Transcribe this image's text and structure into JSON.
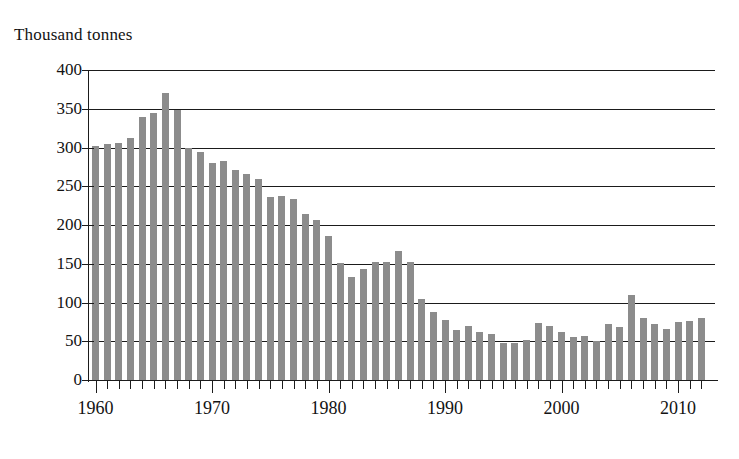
{
  "chart_data": {
    "type": "bar",
    "title": "",
    "subtitle": "",
    "unit_caption": "Thousand tonnes",
    "xlabel": "",
    "ylabel": "Thousand tonnes",
    "ylim": [
      0,
      400
    ],
    "y_ticks": [
      0,
      50,
      100,
      150,
      200,
      250,
      300,
      350,
      400
    ],
    "y_tick_labels": [
      "0",
      "50",
      "100",
      "150",
      "200",
      "250",
      "300",
      "350",
      "400"
    ],
    "grid": "horizontal",
    "legend": "none",
    "bar_color": "#8c8c8c",
    "axis_color": "#1b1b1b",
    "x_tick_labels": [
      "1960",
      "1970",
      "1980",
      "1990",
      "2000",
      "2010"
    ],
    "x_labelled_years": [
      1960,
      1970,
      1980,
      1990,
      2000,
      2010
    ],
    "xlim": [
      1959.5,
      2012.5
    ],
    "categories": [
      "1960",
      "1961",
      "1962",
      "1963",
      "1964",
      "1965",
      "1966",
      "1967",
      "1968",
      "1969",
      "1970",
      "1971",
      "1972",
      "1973",
      "1974",
      "1975",
      "1976",
      "1977",
      "1978",
      "1979",
      "1980",
      "1981",
      "1982",
      "1983",
      "1984",
      "1985",
      "1986",
      "1987",
      "1988",
      "1989",
      "1990",
      "1991",
      "1992",
      "1993",
      "1994",
      "1995",
      "1996",
      "1997",
      "1998",
      "1999",
      "2000",
      "2001",
      "2002",
      "2003",
      "2004",
      "2005",
      "2006",
      "2007",
      "2008",
      "2009",
      "2010",
      "2011",
      "2012"
    ],
    "values": [
      302,
      304,
      306,
      312,
      340,
      344,
      370,
      349,
      300,
      294,
      280,
      282,
      271,
      266,
      260,
      236,
      238,
      234,
      214,
      206,
      186,
      151,
      133,
      143,
      152,
      152,
      166,
      152,
      104,
      88,
      78,
      65,
      70,
      62,
      60,
      48,
      48,
      51,
      73,
      70,
      62,
      55,
      57,
      50,
      72,
      68,
      110,
      80,
      72,
      66,
      75,
      76,
      80
    ]
  }
}
